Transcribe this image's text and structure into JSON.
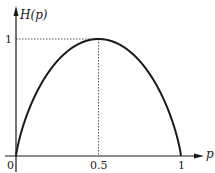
{
  "chart_data": {
    "type": "line",
    "title": "",
    "xlabel": "p",
    "ylabel": "H(p)",
    "xlim": [
      0,
      1
    ],
    "ylim": [
      0,
      1
    ],
    "x_ticks": [
      "0",
      "0.5",
      "1"
    ],
    "y_ticks": [
      "1"
    ],
    "grid": false,
    "legend": null,
    "annotations": [
      "dotted guide lines from (0.5, 0) to (0.5, 1) and from (0, 1) to (0.5, 1)"
    ],
    "series": [
      {
        "name": "H(p)",
        "x": [
          0,
          0.05,
          0.1,
          0.2,
          0.3,
          0.4,
          0.5,
          0.6,
          0.7,
          0.8,
          0.9,
          0.95,
          1
        ],
        "values": [
          0,
          0.286,
          0.469,
          0.722,
          0.881,
          0.971,
          1,
          0.971,
          0.881,
          0.722,
          0.469,
          0.286,
          0
        ]
      }
    ]
  },
  "labels": {
    "y_axis": "H(p)",
    "x_axis": "p",
    "origin": "0",
    "x_mid": "0.5",
    "x_end": "1",
    "y_top": "1"
  },
  "colors": {
    "curve": "#1a1a1a",
    "axis": "#1a1a1a",
    "guide": "#555555"
  }
}
